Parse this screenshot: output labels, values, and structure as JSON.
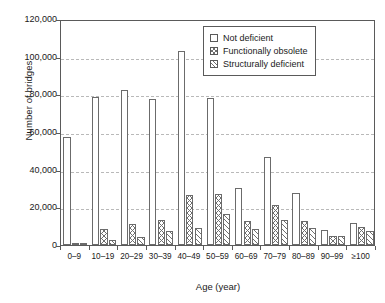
{
  "chart_data": {
    "type": "bar",
    "title": "",
    "xlabel": "Age (year)",
    "ylabel": "Number of bridges",
    "categories": [
      "0–9",
      "10–19",
      "20–29",
      "30–39",
      "40–49",
      "50–59",
      "60–69",
      "70–79",
      "80–89",
      "90–99",
      "≥100"
    ],
    "series": [
      {
        "name": "Not deficient",
        "values": [
          57500,
          78500,
          82500,
          77500,
          103000,
          78000,
          30500,
          46500,
          27500,
          8000,
          11500
        ]
      },
      {
        "name": "Functionally obsolete",
        "values": [
          300,
          8500,
          11000,
          13500,
          26500,
          27000,
          12500,
          21000,
          13000,
          5000,
          9500
        ]
      },
      {
        "name": "Structurally deficient",
        "values": [
          200,
          2500,
          4000,
          7500,
          9000,
          16500,
          8500,
          13500,
          9000,
          5000,
          7500
        ]
      }
    ],
    "ylim": [
      0,
      120000
    ],
    "ytick_values": [
      0,
      20000,
      40000,
      60000,
      80000,
      100000,
      120000
    ],
    "ytick_labels": [
      "0",
      "20,000",
      "40,000",
      "60,000",
      "80,000",
      "100,000",
      "120,000"
    ],
    "grid": "horizontal-dashed",
    "legend_position": "top-right",
    "legend": [
      {
        "label": "Not deficient",
        "pattern": "open-white"
      },
      {
        "label": "Functionally obsolete",
        "pattern": "cross-hatch"
      },
      {
        "label": "Structurally deficient",
        "pattern": "diagonal-hatch"
      }
    ],
    "colors": {
      "bar_edge": "#6b6b6b",
      "hatch": "#6f6f6f",
      "axis": "#5a5a5a",
      "gridline": "#b9b9b9",
      "background": "#ffffff"
    }
  }
}
